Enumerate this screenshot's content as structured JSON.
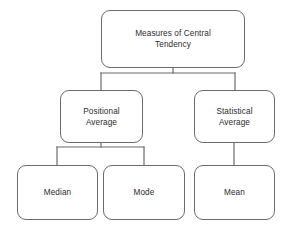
{
  "diagram": {
    "type": "hierarchy-tree",
    "title": "Measures of Central Tendency",
    "style": {
      "box_border_color": "#6b6b6b",
      "box_fill_color": "#ffffff",
      "connector_color": "#6b6b6b",
      "text_color": "#2b2b2b",
      "background_color": "#ffffff"
    },
    "nodes": {
      "root": {
        "label": "Measures of Central\nTendency",
        "level": 1
      },
      "positional": {
        "label": "Positional\nAverage",
        "level": 2
      },
      "statistical": {
        "label": "Statistical\nAverage",
        "level": 2
      },
      "median": {
        "label": "Median",
        "level": 3
      },
      "mode": {
        "label": "Mode",
        "level": 3
      },
      "mean": {
        "label": "Mean",
        "level": 3
      }
    },
    "edges": [
      {
        "from": "root",
        "to": "positional"
      },
      {
        "from": "root",
        "to": "statistical"
      },
      {
        "from": "positional",
        "to": "median"
      },
      {
        "from": "positional",
        "to": "mode"
      },
      {
        "from": "statistical",
        "to": "mean"
      }
    ]
  }
}
